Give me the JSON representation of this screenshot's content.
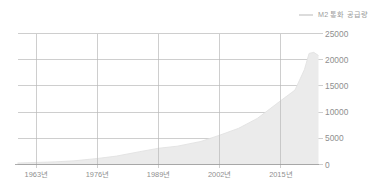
{
  "legend": {
    "items": [
      {
        "label": "M2 통화 공급량",
        "color": "#dcdcdc",
        "icon": "line-swatch-icon"
      }
    ]
  },
  "chart_data": {
    "type": "area",
    "title": "",
    "subtitle": "",
    "xlabel": "",
    "ylabel": "",
    "xlim": [
      1959,
      2023
    ],
    "ylim": [
      0,
      25000
    ],
    "grid": true,
    "legend_position": "top-right",
    "series": [
      {
        "name": "M2 통화 공급량",
        "color": "#ebebeb",
        "line_color": "#e2e2e2",
        "x": [
          1959,
          1963,
          1967,
          1971,
          1976,
          1980,
          1985,
          1989,
          1993,
          1998,
          2002,
          2006,
          2010,
          2015,
          2018,
          2020,
          2021,
          2022,
          2023
        ],
        "values": [
          290,
          390,
          510,
          700,
          1150,
          1600,
          2450,
          3100,
          3500,
          4400,
          5600,
          6900,
          8800,
          12200,
          14200,
          18100,
          21200,
          21400,
          20800
        ]
      }
    ],
    "x_ticks": [
      1963,
      1976,
      1989,
      2002,
      2015
    ],
    "x_tick_labels": [
      "1963년",
      "1976년",
      "1989년",
      "2002년",
      "2015년"
    ],
    "y_ticks": [
      0,
      5000,
      10000,
      15000,
      20000,
      25000
    ],
    "y_tick_labels": [
      "0",
      "5000",
      "10000",
      "15000",
      "20000",
      "25000"
    ]
  },
  "colors": {
    "area_fill": "#ebebeb",
    "grid_line": "#b9b9b9",
    "axis_line": "#9a9a9a",
    "tick_text": "#8f8f8f",
    "background": "#ffffff"
  }
}
